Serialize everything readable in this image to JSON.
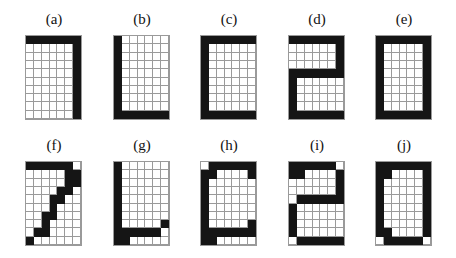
{
  "figure": {
    "grid_cols": 7,
    "grid_rows": 10,
    "panels": [
      {
        "label": "(a)",
        "x": 25,
        "y": 35,
        "rows": [
          "1111111",
          "0000001",
          "0000001",
          "0000001",
          "0000001",
          "0000001",
          "0000001",
          "0000001",
          "0000001",
          "0000001"
        ]
      },
      {
        "label": "(b)",
        "x": 113,
        "y": 35,
        "rows": [
          "1000000",
          "1000000",
          "1000000",
          "1000000",
          "1000000",
          "1000000",
          "1000000",
          "1000000",
          "1000000",
          "1111111"
        ]
      },
      {
        "label": "(c)",
        "x": 200,
        "y": 35,
        "rows": [
          "1111111",
          "1000000",
          "1000000",
          "1000000",
          "1000000",
          "1000000",
          "1000000",
          "1000000",
          "1000000",
          "1111111"
        ]
      },
      {
        "label": "(d)",
        "x": 288,
        "y": 35,
        "rows": [
          "1111111",
          "0000001",
          "0000001",
          "0000001",
          "1111111",
          "1000000",
          "1000000",
          "1000000",
          "1000000",
          "1111111"
        ]
      },
      {
        "label": "(e)",
        "x": 375,
        "y": 35,
        "rows": [
          "1111111",
          "1000001",
          "1000001",
          "1000001",
          "1000001",
          "1000001",
          "1000001",
          "1000001",
          "1000001",
          "1111111"
        ]
      },
      {
        "label": "(f)",
        "x": 25,
        "y": 161,
        "rows": [
          "1111110",
          "0000011",
          "0000011",
          "0000110",
          "0001100",
          "0001000",
          "0011000",
          "0010000",
          "0110000",
          "1000000"
        ]
      },
      {
        "label": "(g)",
        "x": 113,
        "y": 161,
        "rows": [
          "1000000",
          "1000000",
          "1000000",
          "1000000",
          "1000000",
          "1000000",
          "1000000",
          "1000001",
          "1111110",
          "1100000"
        ]
      },
      {
        "label": "(h)",
        "x": 200,
        "y": 161,
        "rows": [
          "0111111",
          "1100001",
          "1000000",
          "1000000",
          "1000000",
          "1000000",
          "1000000",
          "1000001",
          "1111111",
          "1100000"
        ]
      },
      {
        "label": "(i)",
        "x": 288,
        "y": 161,
        "rows": [
          "1111110",
          "1100001",
          "0000001",
          "0000001",
          "0111111",
          "1000000",
          "1000000",
          "1000000",
          "1000000",
          "0111111"
        ]
      },
      {
        "label": "(j)",
        "x": 375,
        "y": 161,
        "rows": [
          "1111111",
          "1100001",
          "1000001",
          "1000001",
          "1000001",
          "1000001",
          "1000001",
          "1000001",
          "1100001",
          "0111110"
        ]
      }
    ],
    "colors": {
      "filled": "#151515",
      "empty": "#ffffff",
      "grid_line": "#9a9a9a"
    }
  }
}
